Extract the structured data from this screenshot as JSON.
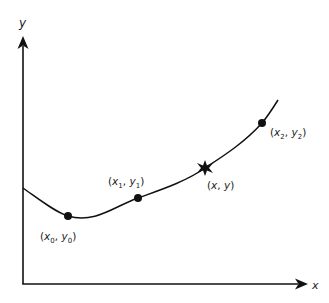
{
  "diagram": {
    "type": "curve-interpolation",
    "axes": {
      "x_label": "x",
      "y_label": "y"
    },
    "points": [
      {
        "id": "p0",
        "var_x": "x",
        "sub_x": "0",
        "var_y": "y",
        "sub_y": "0",
        "marker": "dot"
      },
      {
        "id": "p1",
        "var_x": "x",
        "sub_x": "1",
        "var_y": "y",
        "sub_y": "1",
        "marker": "dot"
      },
      {
        "id": "pxy",
        "var_x": "x",
        "sub_x": "",
        "var_y": "y",
        "sub_y": "",
        "marker": "star"
      },
      {
        "id": "p2",
        "var_x": "x",
        "sub_x": "2",
        "var_y": "y",
        "sub_y": "2",
        "marker": "dot"
      }
    ],
    "labels": {
      "p0": "(x0, y0)",
      "p1": "(x1, y1)",
      "pxy": "(x, y)",
      "p2": "(x2, y2)"
    },
    "colors": {
      "stroke": "#111111",
      "background": "#ffffff"
    }
  }
}
